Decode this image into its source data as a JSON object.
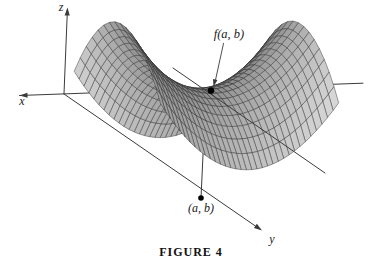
{
  "figure": {
    "caption": "FIGURE 4",
    "axes": {
      "x_label": "x",
      "y_label": "y",
      "z_label": "z"
    },
    "labels": {
      "surface_value": "f(a, b)",
      "domain_point": "(a, b)"
    },
    "colors": {
      "background": "#ffffff",
      "axis_line": "#3b3b3b",
      "mesh_line": "#2f2f2f",
      "surface_dark": "#707070",
      "surface_light": "#d6d6d6",
      "dot": "#000000",
      "text": "#1a1a1a"
    }
  }
}
